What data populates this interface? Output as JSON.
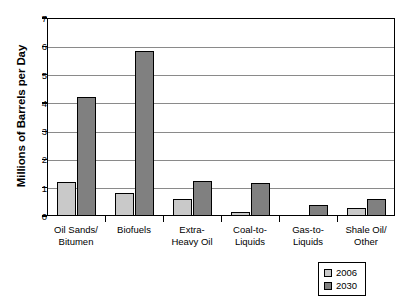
{
  "chart_data": {
    "type": "bar",
    "title": "",
    "xlabel": "",
    "ylabel": "Millions of Barrels per Day",
    "ylim": [
      0,
      7
    ],
    "yticks": [
      0,
      1,
      2,
      3,
      4,
      5,
      6,
      7
    ],
    "ytick_labels": [
      "0",
      "1",
      "2",
      "3",
      "4",
      "5",
      "6",
      "7"
    ],
    "grid": "horizontal",
    "legend_position": "bottom-right-outside",
    "categories": [
      "Oil Sands/\nBitumen",
      "Biofuels",
      "Extra-\nHeavy Oil",
      "Coal-to-\nLiquids",
      "Gas-to-\nLiquids",
      "Shale Oil/\nOther"
    ],
    "category_lines": [
      [
        "Oil Sands/",
        "Bitumen"
      ],
      [
        "Biofuels",
        ""
      ],
      [
        "Extra-",
        "Heavy Oil"
      ],
      [
        "Coal-to-",
        "Liquids"
      ],
      [
        "Gas-to-",
        "Liquids"
      ],
      [
        "Shale Oil/",
        "Other"
      ]
    ],
    "series": [
      {
        "name": "2006",
        "color": "#c9c9c9",
        "values": [
          1.2,
          0.8,
          0.6,
          0.15,
          0.0,
          0.3
        ]
      },
      {
        "name": "2030",
        "color": "#808080",
        "values": [
          4.2,
          5.85,
          1.25,
          1.15,
          0.4,
          0.6
        ]
      }
    ]
  },
  "legend": {
    "entries": [
      {
        "label": "2006",
        "color": "#c9c9c9"
      },
      {
        "label": "2030",
        "color": "#808080"
      }
    ]
  },
  "axes": {
    "y_title": "Millions of Barrels per Day"
  }
}
